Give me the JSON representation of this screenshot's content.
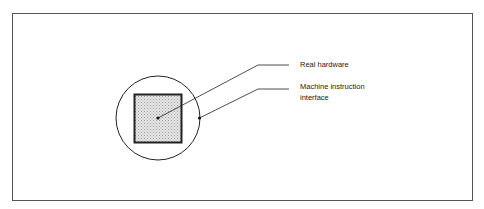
{
  "diagram": {
    "labels": {
      "real_hardware": "Real hardware",
      "machine_instruction_line1": "Machine instruction",
      "machine_instruction_line2": "interface"
    },
    "shapes": {
      "outer_circle": "Machine instruction interface boundary",
      "inner_square": "Real hardware block"
    },
    "colors": {
      "stroke": "#222222",
      "fill_stipple": "#d8d8d8",
      "frame": "#555555"
    }
  }
}
